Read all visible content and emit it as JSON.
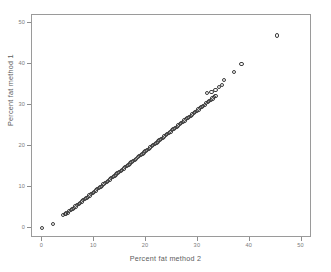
{
  "chart_data": {
    "type": "scatter",
    "title": "",
    "xlabel": "Percent fat method 2",
    "ylabel": "Percent fat method 1",
    "xlim": [
      -2,
      52
    ],
    "ylim": [
      -2.5,
      52
    ],
    "xticks": [
      0,
      10,
      20,
      30,
      40,
      50
    ],
    "yticks": [
      0,
      10,
      20,
      30,
      40,
      50
    ],
    "xticklabels": [
      "0",
      "10",
      "20",
      "30",
      "40",
      "50"
    ],
    "yticklabels": [
      "0",
      "10",
      "20",
      "30",
      "40",
      "50"
    ],
    "grid": false,
    "legend": null,
    "marker": "open-circle",
    "marker_color": "#3b3b3b",
    "frame_color": "#9a9a9a",
    "background_color": "#ffffff",
    "series": [
      {
        "name": "Percent fat method 1 vs method 2",
        "points": [
          [
            0.0,
            0.0
          ],
          [
            2.0,
            0.9
          ],
          [
            4.0,
            3.2
          ],
          [
            4.3,
            3.3
          ],
          [
            4.6,
            3.5
          ],
          [
            4.9,
            3.7
          ],
          [
            5.2,
            4.0
          ],
          [
            5.5,
            4.3
          ],
          [
            5.8,
            4.6
          ],
          [
            6.1,
            4.9
          ],
          [
            6.4,
            5.2
          ],
          [
            6.7,
            5.5
          ],
          [
            7.0,
            5.8
          ],
          [
            7.3,
            6.1
          ],
          [
            7.6,
            6.4
          ],
          [
            7.9,
            6.7
          ],
          [
            8.2,
            7.0
          ],
          [
            8.5,
            7.3
          ],
          [
            8.8,
            7.6
          ],
          [
            9.1,
            7.9
          ],
          [
            9.4,
            8.2
          ],
          [
            9.7,
            8.5
          ],
          [
            10.0,
            8.8
          ],
          [
            10.3,
            9.1
          ],
          [
            10.6,
            9.4
          ],
          [
            10.9,
            9.7
          ],
          [
            11.2,
            10.0
          ],
          [
            11.5,
            10.3
          ],
          [
            11.8,
            10.6
          ],
          [
            12.1,
            10.9
          ],
          [
            12.4,
            11.2
          ],
          [
            12.7,
            11.5
          ],
          [
            13.0,
            11.8
          ],
          [
            13.3,
            12.1
          ],
          [
            13.6,
            12.4
          ],
          [
            13.9,
            12.7
          ],
          [
            14.2,
            13.0
          ],
          [
            14.5,
            13.3
          ],
          [
            14.8,
            13.6
          ],
          [
            15.1,
            13.9
          ],
          [
            15.4,
            14.2
          ],
          [
            15.7,
            14.5
          ],
          [
            16.0,
            14.8
          ],
          [
            16.3,
            15.1
          ],
          [
            16.6,
            15.4
          ],
          [
            16.9,
            15.7
          ],
          [
            17.2,
            16.0
          ],
          [
            17.5,
            16.3
          ],
          [
            17.8,
            16.6
          ],
          [
            18.1,
            16.9
          ],
          [
            18.4,
            17.2
          ],
          [
            18.7,
            17.5
          ],
          [
            19.0,
            17.8
          ],
          [
            19.3,
            18.1
          ],
          [
            19.6,
            18.4
          ],
          [
            19.9,
            18.7
          ],
          [
            20.2,
            19.0
          ],
          [
            20.5,
            19.3
          ],
          [
            20.8,
            19.6
          ],
          [
            21.1,
            19.9
          ],
          [
            21.4,
            20.2
          ],
          [
            21.7,
            20.5
          ],
          [
            22.0,
            20.8
          ],
          [
            22.3,
            21.1
          ],
          [
            22.6,
            21.4
          ],
          [
            22.9,
            21.7
          ],
          [
            23.2,
            22.0
          ],
          [
            23.5,
            22.3
          ],
          [
            23.8,
            22.6
          ],
          [
            24.1,
            22.9
          ],
          [
            24.4,
            23.2
          ],
          [
            24.7,
            23.5
          ],
          [
            25.0,
            23.8
          ],
          [
            25.3,
            24.1
          ],
          [
            25.6,
            24.4
          ],
          [
            25.9,
            24.7
          ],
          [
            26.2,
            25.0
          ],
          [
            26.5,
            25.3
          ],
          [
            26.8,
            25.6
          ],
          [
            27.1,
            25.9
          ],
          [
            27.4,
            26.2
          ],
          [
            27.7,
            26.5
          ],
          [
            28.0,
            26.8
          ],
          [
            28.3,
            27.1
          ],
          [
            28.6,
            27.4
          ],
          [
            28.9,
            27.7
          ],
          [
            29.2,
            28.0
          ],
          [
            29.5,
            28.3
          ],
          [
            29.8,
            28.6
          ],
          [
            30.1,
            28.9
          ],
          [
            30.4,
            29.2
          ],
          [
            30.7,
            29.5
          ],
          [
            31.0,
            29.8
          ],
          [
            31.3,
            30.1
          ],
          [
            31.6,
            30.4
          ],
          [
            31.9,
            30.7
          ],
          [
            32.2,
            31.0
          ],
          [
            32.5,
            31.3
          ],
          [
            32.8,
            31.6
          ],
          [
            33.1,
            31.9
          ],
          [
            33.4,
            32.2
          ],
          [
            31.8,
            33.0
          ],
          [
            32.6,
            33.2
          ],
          [
            33.4,
            33.6
          ],
          [
            34.0,
            34.5
          ],
          [
            34.6,
            34.8
          ],
          [
            35.0,
            36.1
          ],
          [
            37.0,
            38.0
          ],
          [
            38.4,
            40.0
          ],
          [
            45.2,
            47.0
          ]
        ]
      }
    ]
  }
}
